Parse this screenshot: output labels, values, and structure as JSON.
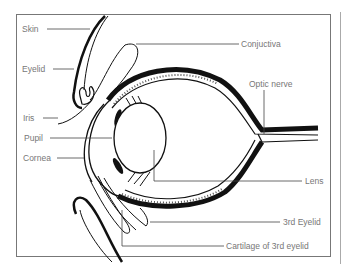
{
  "diagram": {
    "labels": {
      "skin": "Skin",
      "eyelid": "Eyelid",
      "iris": "Iris",
      "pupil": "Pupil",
      "cornea": "Cornea",
      "conjuctiva": "Conjuctiva",
      "optic_nerve": "Optic nerve",
      "lens": "Lens",
      "third_eyelid": "3rd Eyelid",
      "cartilage": "Cartilage of 3rd eyelid"
    },
    "colors": {
      "ink": "#111111",
      "label": "#777777",
      "frame": "#777777"
    }
  }
}
